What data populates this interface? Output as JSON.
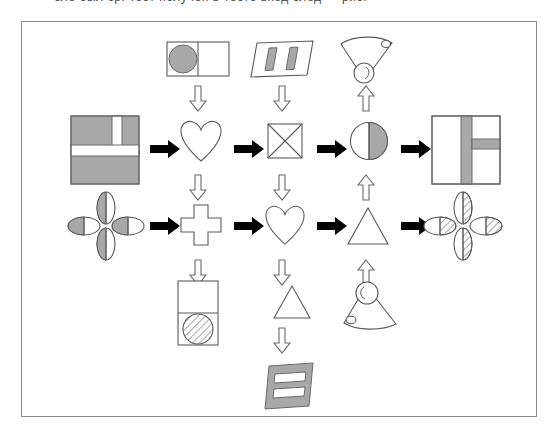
{
  "top_strip": {
    "cut_off_text": "сле был  ср. тест получен в тесте вход след — рис."
  },
  "diagram": {
    "type": "flowchart",
    "title": "",
    "frame": {
      "border_color": "#8c8c8c",
      "background": "#ffffff"
    },
    "grid": {
      "rows": 2,
      "columns": 5
    },
    "colors": {
      "gray_fill": "#a8a8a8",
      "outline": "#5a5a5a",
      "arrow_black": "#000000",
      "arrow_hollow_outline": "#6a6a6a",
      "background": "#ffffff"
    },
    "nodes": [
      {
        "id": "r1c1",
        "row": 1,
        "column": 1,
        "icon": "square-gray-with-white-t-bands",
        "label": "Gray square with white T-shaped bands",
        "fill": "gray"
      },
      {
        "id": "r1c2",
        "row": 1,
        "column": 2,
        "icon": "heart-outline",
        "label": "Heart outline",
        "fill": "white"
      },
      {
        "id": "r1c3",
        "row": 1,
        "column": 3,
        "icon": "square-with-x",
        "label": "Square with crossed diagonals",
        "fill": "white"
      },
      {
        "id": "r1c4",
        "row": 1,
        "column": 4,
        "icon": "circle-half-shaded",
        "label": "Circle with right half shaded",
        "fill": "half-gray"
      },
      {
        "id": "r1c5",
        "row": 1,
        "column": 5,
        "icon": "square-white-with-gray-bands",
        "label": "White square with gray T-shaped bands",
        "fill": "white"
      },
      {
        "id": "r2c1",
        "row": 2,
        "column": 1,
        "icon": "four-petal-flower-gray",
        "label": "Four petal flower, half-shaded petals",
        "fill": "gray"
      },
      {
        "id": "r2c2",
        "row": 2,
        "column": 2,
        "icon": "plus-cross-outline",
        "label": "Plus cross outline",
        "fill": "white"
      },
      {
        "id": "r2c3",
        "row": 2,
        "column": 3,
        "icon": "heart-outline",
        "label": "Heart outline",
        "fill": "white"
      },
      {
        "id": "r2c4",
        "row": 2,
        "column": 4,
        "icon": "triangle-outline",
        "label": "Triangle outline",
        "fill": "white"
      },
      {
        "id": "r2c5",
        "row": 2,
        "column": 5,
        "icon": "four-petal-flower-hatched",
        "label": "Four petal flower, hatched petals",
        "fill": "hatched"
      }
    ],
    "operators": [
      {
        "id": "op-top-c2",
        "position": "above-r1c2",
        "icon": "rect-two-cells-circle-gray",
        "label": "Rectangle of two cells, gray circle in left cell"
      },
      {
        "id": "op-top-c3",
        "position": "above-r1c3",
        "icon": "slanted-rect-two-gray-bars",
        "label": "Slanted rectangle with two gray vertical bars"
      },
      {
        "id": "op-top-c4",
        "position": "above-r1c4",
        "icon": "fan-with-circle-down",
        "label": "Fan shape with circle at bottom"
      },
      {
        "id": "op-mid-c2",
        "position": "between-rows-c2",
        "icon": "down-arrow-hollow",
        "label": "Hollow down arrow"
      },
      {
        "id": "op-mid-c3",
        "position": "between-rows-c3",
        "icon": "down-arrow-hollow",
        "label": "Hollow down arrow"
      },
      {
        "id": "op-mid-c4",
        "position": "between-rows-c4",
        "icon": "up-arrow-hollow",
        "label": "Hollow up arrow"
      },
      {
        "id": "op-bot-c2",
        "position": "below-r2c2",
        "icon": "rect-two-cells-hatched-circle",
        "label": "Vertical rectangle, hatched circle in bottom cell"
      },
      {
        "id": "op-bot-c3",
        "position": "below-r2c3",
        "icon": "triangle-outline",
        "label": "Triangle outline"
      },
      {
        "id": "op-bot2-c3",
        "position": "below-bottom-c3",
        "icon": "slanted-gray-rect-two-white-bars",
        "label": "Slanted gray rectangle with two white bars"
      },
      {
        "id": "op-bot-c4",
        "position": "below-r2c4",
        "icon": "cone-with-circle-up",
        "label": "Cone shape with circle at top"
      }
    ],
    "arrows": {
      "horizontal": [
        {
          "id": "arrow-r1-1",
          "from": "r1c1",
          "to": "r1c2",
          "style": "solid-black",
          "direction": "right"
        },
        {
          "id": "arrow-r1-2",
          "from": "r1c2",
          "to": "r1c3",
          "style": "solid-black",
          "direction": "right"
        },
        {
          "id": "arrow-r1-3",
          "from": "r1c3",
          "to": "r1c4",
          "style": "solid-black",
          "direction": "right"
        },
        {
          "id": "arrow-r1-4",
          "from": "r1c4",
          "to": "r1c5",
          "style": "solid-black",
          "direction": "right"
        },
        {
          "id": "arrow-r2-1",
          "from": "r2c1",
          "to": "r2c2",
          "style": "solid-black",
          "direction": "right"
        },
        {
          "id": "arrow-r2-2",
          "from": "r2c2",
          "to": "r2c3",
          "style": "solid-black",
          "direction": "right"
        },
        {
          "id": "arrow-r2-3",
          "from": "r2c3",
          "to": "r2c4",
          "style": "solid-black",
          "direction": "right"
        },
        {
          "id": "arrow-r2-4",
          "from": "r2c4",
          "to": "r2c5",
          "style": "solid-black",
          "direction": "right"
        }
      ],
      "vertical": [
        {
          "id": "varrow-top-c2",
          "style": "hollow",
          "direction": "down"
        },
        {
          "id": "varrow-top-c3",
          "style": "hollow",
          "direction": "down"
        },
        {
          "id": "varrow-top-c4",
          "style": "hollow",
          "direction": "up"
        },
        {
          "id": "varrow-mid-c2",
          "style": "hollow",
          "direction": "down"
        },
        {
          "id": "varrow-mid-c3",
          "style": "hollow",
          "direction": "down"
        },
        {
          "id": "varrow-mid-c4",
          "style": "hollow",
          "direction": "up"
        },
        {
          "id": "varrow-bot-c3",
          "style": "hollow",
          "direction": "down"
        },
        {
          "id": "varrow-bot-c4",
          "style": "hollow",
          "direction": "up"
        }
      ]
    }
  }
}
